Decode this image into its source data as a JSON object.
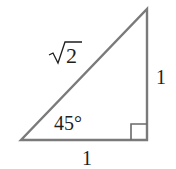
{
  "diagram": {
    "type": "right-triangle",
    "colors": {
      "stroke": "#7a7a7a",
      "text": "#1e1e1e",
      "background": "#ffffff"
    },
    "vertices": {
      "bottom_left": [
        21,
        140
      ],
      "bottom_right": [
        147,
        140
      ],
      "top_right": [
        147,
        9
      ]
    },
    "labels": {
      "hypotenuse": "√2",
      "hypotenuse_radicand": "2",
      "vertical_side": "1",
      "horizontal_side": "1",
      "angle": "45°"
    },
    "right_angle_marker": {
      "size": 16
    }
  }
}
